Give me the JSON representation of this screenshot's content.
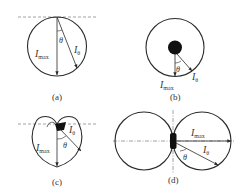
{
  "figure": {
    "panels": [
      {
        "id": "a",
        "caption": "(a)",
        "labels": {
          "imax": "I",
          "imax_sub": "max",
          "itheta": "I",
          "itheta_sub": "θ",
          "theta": "θ"
        },
        "description": "Circular intensity pattern tangent to dashed horizontal surface line; I_max points straight down, I_θ at angle θ"
      },
      {
        "id": "b",
        "caption": "(b)",
        "labels": {
          "imax": "I",
          "imax_sub": "max",
          "itheta": "I",
          "itheta_sub": "θ",
          "theta": "θ"
        },
        "description": "Circular pattern with dark point source at center; uniform intensity in all directions"
      },
      {
        "id": "c",
        "caption": "(c)",
        "labels": {
          "imax": "I",
          "imax_sub": "max",
          "itheta": "I",
          "itheta_sub": "θ",
          "theta": "θ"
        },
        "description": "Heart-shaped (cardioid-like) pattern with shaded source at top on dashed line"
      },
      {
        "id": "d",
        "caption": "(d)",
        "labels": {
          "imax": "I",
          "imax_sub": "max",
          "itheta": "I",
          "itheta_sub": "θ",
          "theta": "θ"
        },
        "description": "Two tangent circles (figure-eight) around a vertical dark source; I_max horizontal, I_θ at angle θ"
      }
    ]
  },
  "colors": {
    "line": "#2a2a2a",
    "dash": "#8a8a8a",
    "source": "#111111",
    "background": "#ffffff"
  }
}
